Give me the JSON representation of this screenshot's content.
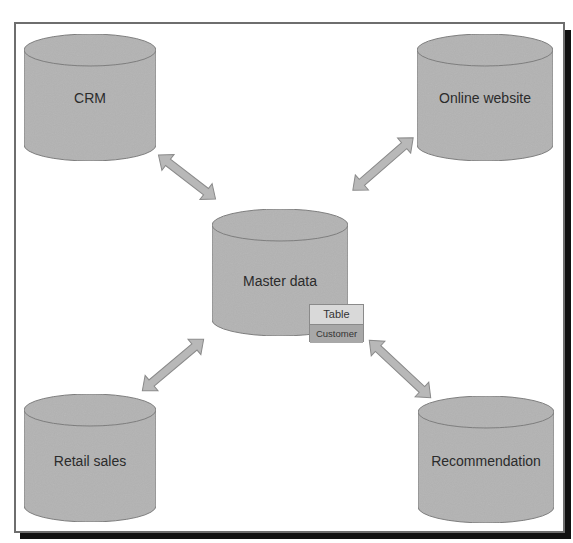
{
  "diagram": {
    "title": "",
    "colors": {
      "cylinder_fill": "#b3b3b3",
      "cylinder_stroke": "#7a7a7a",
      "arrow_fill": "#b8b8b8",
      "arrow_stroke": "#8a8a8a",
      "frame_border": "#6e6e6e",
      "frame_shadow": "#111111"
    },
    "nodes": [
      {
        "id": "crm",
        "label": "CRM",
        "shape": "cylinder",
        "position": "top-left"
      },
      {
        "id": "online",
        "label": "Online website",
        "shape": "cylinder",
        "position": "top-right"
      },
      {
        "id": "master",
        "label": "Master data",
        "shape": "cylinder",
        "position": "center"
      },
      {
        "id": "retail",
        "label": "Retail sales",
        "shape": "cylinder",
        "position": "bottom-left"
      },
      {
        "id": "recommend",
        "label": "Recommendation",
        "shape": "cylinder",
        "position": "bottom-right"
      }
    ],
    "table": {
      "header": "Table",
      "row": "Customer",
      "attached_to": "master"
    },
    "edges": [
      {
        "from": "crm",
        "to": "master",
        "direction": "bidirectional"
      },
      {
        "from": "online",
        "to": "master",
        "direction": "bidirectional"
      },
      {
        "from": "retail",
        "to": "master",
        "direction": "bidirectional"
      },
      {
        "from": "recommend",
        "to": "master",
        "direction": "bidirectional"
      }
    ]
  }
}
